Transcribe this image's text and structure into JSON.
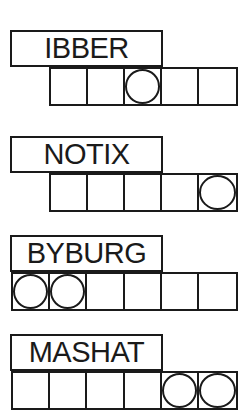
{
  "puzzles": [
    {
      "scrambled_word": "IBBER",
      "cell_count": 5,
      "circled_cells": [
        3
      ],
      "top": 30
    },
    {
      "scrambled_word": "NOTIX",
      "cell_count": 5,
      "circled_cells": [
        5
      ],
      "top": 136
    },
    {
      "scrambled_word": "BYBURG",
      "cell_count": 6,
      "circled_cells": [
        1,
        2
      ],
      "top": 235
    },
    {
      "scrambled_word": "MASHAT",
      "cell_count": 6,
      "circled_cells": [
        5,
        6
      ],
      "top": 334
    }
  ]
}
